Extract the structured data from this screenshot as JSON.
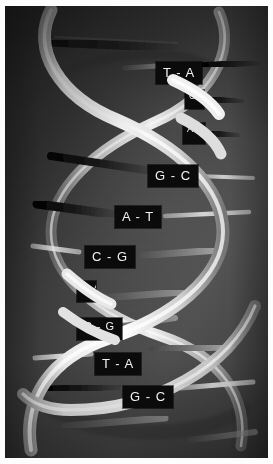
{
  "figure": {
    "rendering": "monochrome photograph of a physical DNA double helix model on a graduated grey backdrop",
    "palette": {
      "backdrop_dark": "#3f3f3f",
      "backdrop_mid": "#7b7b7b",
      "backdrop_light": "#9d9d9d",
      "ribbon_highlight": "#fdfdfd",
      "ribbon_mid": "#d8d8d8",
      "ribbon_shadow": "#6a6a6a",
      "rung_dark": "#141414",
      "rung_light": "#cfcfcf",
      "label_background": "#0b0b0b",
      "label_text": "#f2f2f2",
      "plate_border": "#ffffff"
    }
  },
  "base_pair_labels": [
    {
      "id": "bp-1",
      "text": "T - A",
      "size": "lg",
      "x": 156,
      "y": 56,
      "occluded": false
    },
    {
      "id": "bp-2",
      "text": "C - G",
      "size": "sm",
      "x": 184,
      "y": 85,
      "occluded": true
    },
    {
      "id": "bp-3",
      "text": "A - T",
      "size": "sm",
      "x": 180,
      "y": 119,
      "occluded": true
    },
    {
      "id": "bp-4",
      "text": "G - C",
      "size": "lg",
      "x": 148,
      "y": 159,
      "occluded": false
    },
    {
      "id": "bp-5",
      "text": "A - T",
      "size": "lg",
      "x": 114,
      "y": 200,
      "occluded": false
    },
    {
      "id": "bp-6",
      "text": "C - G",
      "size": "lg",
      "x": 84,
      "y": 240,
      "occluded": false
    },
    {
      "id": "bp-7",
      "text": "T - A",
      "size": "sm",
      "x": 76,
      "y": 277,
      "occluded": true
    },
    {
      "id": "bp-8",
      "text": "C - G",
      "size": "md",
      "x": 78,
      "y": 314,
      "occluded": true
    },
    {
      "id": "bp-9",
      "text": "T - A",
      "size": "lg",
      "x": 94,
      "y": 348,
      "occluded": false
    },
    {
      "id": "bp-10",
      "text": "G - C",
      "size": "lg",
      "x": 122,
      "y": 381,
      "occluded": false
    }
  ],
  "structure": {
    "strand_count": 2,
    "strand_names": [
      "sugar-phosphate-backbone-front",
      "sugar-phosphate-backbone-back"
    ],
    "turns_visible": 3,
    "rung_count": 10,
    "description": "Two antiparallel helical ribbons wound about a common vertical axis, joined by flat base-pair rungs."
  }
}
